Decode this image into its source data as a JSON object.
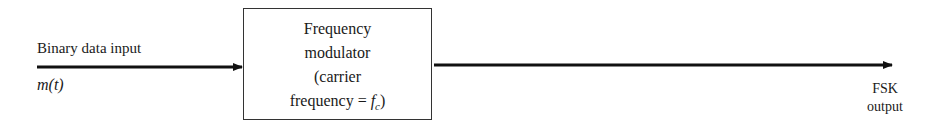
{
  "diagram": {
    "type": "block-diagram",
    "input": {
      "label": "Binary data input",
      "signal": "m(t)"
    },
    "block": {
      "lines": [
        "Frequency",
        "modulator",
        "(carrier",
        "frequency = "
      ],
      "symbol_base": "f",
      "symbol_sub": "c",
      "close_paren": ")"
    },
    "output": {
      "line1": "FSK",
      "line2": "output"
    },
    "colors": {
      "line": "#111111",
      "box_border": "#333333",
      "text": "#1a1a1a",
      "background": "#ffffff"
    }
  }
}
